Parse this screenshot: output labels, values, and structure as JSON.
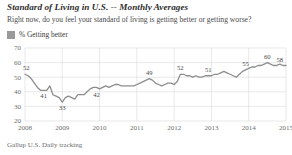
{
  "header": {
    "title": "Standard of Living in U.S. -- Monthly Averages",
    "subtitle": "Right now, do you feel your standard of living is getting better or getting worse?"
  },
  "legend": {
    "swatch_color": "#9a9a9a",
    "label": "% Getting better"
  },
  "footer": {
    "source": "Gallup U.S. Daily tracking"
  },
  "chart_data": {
    "type": "line",
    "title": "Standard of Living in U.S. -- Monthly Averages",
    "subtitle": "Right now, do you feel your standard of living is getting better or getting worse?",
    "xlabel": "",
    "ylabel": "",
    "ylim": [
      20,
      70
    ],
    "yticks": [
      20,
      30,
      40,
      50,
      60,
      70
    ],
    "xticks": [
      "2008",
      "2009",
      "2010",
      "2011",
      "2012",
      "2013",
      "2014",
      "2015"
    ],
    "grid": true,
    "legend_position": "top-left",
    "line_color": "#8d8d8d",
    "series": [
      {
        "name": "% Getting better",
        "values": [
          52,
          51,
          49,
          46,
          43,
          41,
          41,
          41,
          44,
          38,
          37,
          36,
          33,
          36,
          37,
          36,
          35,
          38,
          38,
          38,
          40,
          42,
          43,
          43,
          42,
          43,
          44,
          43,
          44,
          45,
          45,
          44,
          44,
          44,
          44,
          44,
          45,
          46,
          47,
          48,
          49,
          48,
          46,
          45,
          44,
          45,
          46,
          46,
          45,
          47,
          52,
          52,
          51,
          51,
          50,
          51,
          50,
          50,
          51,
          51,
          51,
          52,
          52,
          53,
          54,
          53,
          52,
          51,
          50,
          52,
          54,
          55,
          56,
          57,
          57,
          58,
          58,
          59,
          60,
          59,
          58,
          58,
          59,
          58,
          58
        ]
      }
    ],
    "point_labels": [
      {
        "index": 0,
        "value": 52,
        "text": "52"
      },
      {
        "index": 6,
        "value": 41,
        "text": "41"
      },
      {
        "index": 12,
        "value": 33,
        "text": "33"
      },
      {
        "index": 23,
        "value": 42,
        "text": "42"
      },
      {
        "index": 40,
        "value": 49,
        "text": "49"
      },
      {
        "index": 50,
        "value": 52,
        "text": "52"
      },
      {
        "index": 59,
        "value": 51,
        "text": "51"
      },
      {
        "index": 71,
        "value": 55,
        "text": "55"
      },
      {
        "index": 78,
        "value": 60,
        "text": "60"
      },
      {
        "index": 82,
        "value": 58,
        "text": "58"
      }
    ]
  }
}
